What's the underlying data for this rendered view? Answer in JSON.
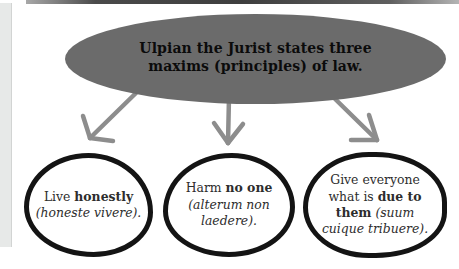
{
  "colors": {
    "background": "#ffffff",
    "top-bar": "#3e3e3e",
    "left-stripe": "#e7e9e8",
    "ellipse-fill": "#6b6b6b",
    "title-text": "#0b0b0b",
    "arrow": "#8d8d8d",
    "circle-stroke": "#141414",
    "node-text": "#2d2d2d"
  },
  "diagram": {
    "root": {
      "id": "ulpian-maxims",
      "lines": [
        "Ulpian the Jurist states three",
        "maxims (principles) of law."
      ]
    },
    "nodes": [
      {
        "id": "live-honestly",
        "text": "Live honestly (honeste vivere).",
        "segments": [
          {
            "t": "Live "
          },
          {
            "t": "honestly",
            "b": true
          },
          {
            "t": " "
          },
          {
            "t": "(honeste vivere).",
            "i": true
          }
        ]
      },
      {
        "id": "harm-no-one",
        "text": "Harm no one (alterum non laedere).",
        "segments": [
          {
            "t": "Harm "
          },
          {
            "t": "no one",
            "b": true
          },
          {
            "t": " "
          },
          {
            "t": "(alterum non laedere).",
            "i": true
          }
        ]
      },
      {
        "id": "give-everyone-their-due",
        "text": "Give everyone what is due to them (suum cuique tribuere).",
        "segments": [
          {
            "t": "Give everyone what is "
          },
          {
            "t": "due to them",
            "b": true
          },
          {
            "t": " "
          },
          {
            "t": "(suum cuique tribuere).",
            "i": true
          }
        ]
      }
    ]
  }
}
